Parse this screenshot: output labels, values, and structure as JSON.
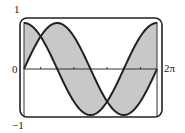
{
  "chart_data": {
    "type": "area",
    "title": "",
    "xlabel": "",
    "ylabel": "",
    "xlim": [
      0,
      6.2832
    ],
    "ylim": [
      -1,
      1
    ],
    "grid": false,
    "legend": null,
    "tick_labels": {
      "y_max": "1",
      "y_min": "−1",
      "origin": "0",
      "x_max": "2π"
    },
    "x_ticks": [
      0.7854,
      1.5708,
      2.3562,
      3.1416,
      3.927,
      4.7124,
      5.4978
    ],
    "series": [
      {
        "name": "sin x",
        "expression": "sin(x)",
        "x": [
          0,
          0.7854,
          1.5708,
          2.3562,
          3.1416,
          3.927,
          4.7124,
          5.4978,
          6.2832
        ],
        "values": [
          0,
          0.707,
          1,
          0.707,
          0,
          -0.707,
          -1,
          -0.707,
          0
        ]
      },
      {
        "name": "cos x",
        "expression": "cos(x)",
        "x": [
          0,
          0.7854,
          1.5708,
          2.3562,
          3.1416,
          3.927,
          4.7124,
          5.4978,
          6.2832
        ],
        "values": [
          1,
          0.707,
          0,
          -0.707,
          -1,
          -0.707,
          0,
          0.707,
          1
        ]
      }
    ],
    "shaded_region": "between sin x and cos x on [0, 2π]",
    "intersections": [
      {
        "x": 0.7854,
        "y": 0.707
      },
      {
        "x": 3.927,
        "y": -0.707
      }
    ],
    "colors": {
      "curve": "#222222",
      "fill": "#c8c8c8",
      "frame": "#222222",
      "axis": "#333333"
    }
  }
}
